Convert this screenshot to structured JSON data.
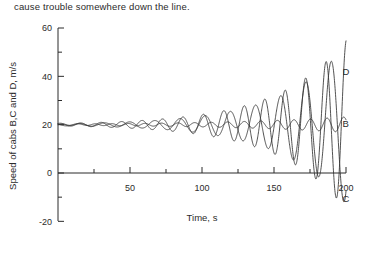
{
  "page": {
    "body_text": "cause trouble somewhere down the line."
  },
  "chart_data": {
    "type": "line",
    "title": "",
    "xlabel": "Time, s",
    "ylabel": "Speed of cabs B,C and D, m/s",
    "xlim": [
      0,
      200
    ],
    "ylim": [
      -25,
      60
    ],
    "x_ticks": [
      50,
      100,
      150,
      200
    ],
    "x_tick_labels": [
      "50",
      "100",
      "150",
      "200"
    ],
    "x_minor_ticks": [
      25,
      75,
      125,
      175
    ],
    "y_ticks": [
      -20,
      0,
      20,
      40,
      60
    ],
    "y_tick_labels": [
      "-20",
      "0",
      "20",
      "40",
      "60"
    ],
    "y_minor_ticks": [
      -10,
      10,
      30,
      50
    ],
    "grid": false,
    "legend_position": "right-inline",
    "series": [
      {
        "name": "B",
        "label": "B",
        "label_x": 192,
        "label_y": 20.5,
        "description": "small-amplitude oscillation about 20 m/s, amplitude approx 3 m/s, steady",
        "baseline": 20,
        "amplitude_start": 0.3,
        "amplitude_end": 3.2,
        "period": 11.5,
        "phase": 0.0,
        "growth_start_time": 10
      },
      {
        "name": "C",
        "label": "C",
        "label_x": 192,
        "label_y": -10.5,
        "description": "growing oscillation about 20 m/s reaching peaks near 50 and troughs near -22",
        "baseline": 20,
        "amplitude_start": 0.5,
        "amplitude_end": 33,
        "period": 17.5,
        "phase": 2.6,
        "growth_start_time": 12
      },
      {
        "name": "D",
        "label": "D",
        "label_x": 192,
        "label_y": 42,
        "description": "growing oscillation about 20 m/s reaching peaks near 55 and troughs near -22",
        "baseline": 20,
        "amplitude_start": 0.6,
        "amplitude_end": 35,
        "period": 14.2,
        "phase": 0.9,
        "growth_start_time": 8
      }
    ]
  }
}
